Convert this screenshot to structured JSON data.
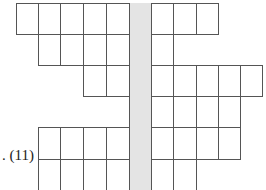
{
  "puzzle": {
    "label": ". (11)",
    "grid": {
      "col_x": [
        16,
        38,
        60,
        83,
        106,
        129,
        151,
        173,
        196,
        218,
        240,
        262
      ],
      "row_y": [
        3,
        34,
        65,
        96,
        127,
        159,
        190
      ],
      "rows": [
        {
          "cols": [
            0,
            1,
            2,
            3,
            4,
            6,
            7,
            8
          ]
        },
        {
          "cols": [
            1,
            2,
            3,
            4,
            6
          ]
        },
        {
          "cols": [
            3,
            4,
            6,
            7,
            8,
            9,
            10
          ]
        },
        {
          "cols": [
            6,
            7,
            8,
            9
          ]
        },
        {
          "cols": [
            1,
            2,
            3,
            4,
            6,
            7,
            8,
            9
          ]
        },
        {
          "cols": [
            1,
            2,
            3,
            4,
            6,
            7
          ]
        }
      ],
      "shaded_column": {
        "col": 5,
        "from_row": 0,
        "to_row": 5
      },
      "shade_color": "#e4e4e4"
    }
  }
}
